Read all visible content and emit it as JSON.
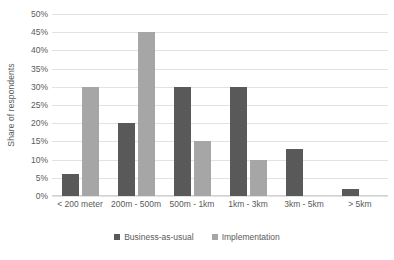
{
  "chart_data": {
    "type": "bar",
    "title": "",
    "subtitle": "",
    "xlabel": "",
    "ylabel": "Share of respondents",
    "ylim": [
      0,
      50
    ],
    "ytick_step": 5,
    "ytick_labels": [
      "50%",
      "45%",
      "40%",
      "35%",
      "30%",
      "25%",
      "20%",
      "15%",
      "10%",
      "5%",
      "0%"
    ],
    "ytick_values": [
      50,
      45,
      40,
      35,
      30,
      25,
      20,
      15,
      10,
      5,
      0
    ],
    "grid": true,
    "grid_axis": "y",
    "legend_position": "bottom",
    "categories": [
      "< 200 meter",
      "200m - 500m",
      "500m - 1km",
      "1km - 3km",
      "3km - 5km",
      "> 5km"
    ],
    "series": [
      {
        "name": "Business-as-usual",
        "color": "#595959",
        "values": [
          6,
          20,
          30,
          30,
          13,
          2
        ]
      },
      {
        "name": "Implementation",
        "color": "#a6a6a6",
        "values": [
          30,
          45,
          15,
          10,
          0,
          0
        ]
      }
    ]
  },
  "colors": {
    "background": "#ffffff",
    "gridline": "#e2e2e2",
    "axis_line": "#d2d2d2",
    "text": "#5a5a5a",
    "series_business_as_usual": "#595959",
    "series_implementation": "#a6a6a6"
  }
}
